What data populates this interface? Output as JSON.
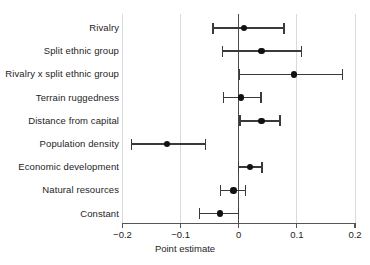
{
  "chart_data": {
    "type": "scatter",
    "subtype": "coefficient-plot-with-error-bars",
    "title": "",
    "xlabel": "Point estimate",
    "ylabel": "",
    "xlim": [
      -0.2,
      0.2
    ],
    "xticks": [
      -0.2,
      -0.1,
      0,
      0.1,
      0.2
    ],
    "xtick_labels": [
      "−0.2",
      "−0.1",
      "0",
      "0.1",
      "0.2"
    ],
    "grid": "vertical",
    "reference_line": 0,
    "legend": "none",
    "categories": [
      "Rivalry",
      "Split ethnic group",
      "Rivalry x split ethnic group",
      "Terrain ruggedness",
      "Distance from capital",
      "Population density",
      "Economic development",
      "Natural resources",
      "Constant"
    ],
    "values": [
      0.009,
      0.039,
      0.095,
      0.004,
      0.039,
      -0.123,
      0.019,
      -0.009,
      -0.032
    ],
    "ci_low": [
      -0.044,
      -0.028,
      0.001,
      -0.026,
      0.002,
      -0.185,
      0.0,
      -0.031,
      -0.067
    ],
    "ci_high": [
      0.078,
      0.108,
      0.178,
      0.038,
      0.071,
      -0.057,
      0.04,
      0.012,
      0.0
    ],
    "points": [
      {
        "label": "Rivalry",
        "estimate": 0.009,
        "ci_low": -0.044,
        "ci_high": 0.078
      },
      {
        "label": "Split ethnic group",
        "estimate": 0.039,
        "ci_low": -0.028,
        "ci_high": 0.108
      },
      {
        "label": "Rivalry x split ethnic group",
        "estimate": 0.095,
        "ci_low": 0.001,
        "ci_high": 0.178
      },
      {
        "label": "Terrain ruggedness",
        "estimate": 0.004,
        "ci_low": -0.026,
        "ci_high": 0.038
      },
      {
        "label": "Distance from capital",
        "estimate": 0.039,
        "ci_low": 0.002,
        "ci_high": 0.071
      },
      {
        "label": "Population density",
        "estimate": -0.123,
        "ci_low": -0.185,
        "ci_high": -0.057
      },
      {
        "label": "Economic development",
        "estimate": 0.019,
        "ci_low": 0.0,
        "ci_high": 0.04
      },
      {
        "label": "Natural resources",
        "estimate": -0.009,
        "ci_low": -0.031,
        "ci_high": 0.012
      },
      {
        "label": "Constant",
        "estimate": -0.032,
        "ci_low": -0.067,
        "ci_high": 0.0
      }
    ],
    "colors": {
      "point": "#111111",
      "error_bar": "#3a3a3a",
      "grid": "#d9d9d9",
      "zero_line": "#4a4a4a",
      "axis": "#555555",
      "text": "#242424",
      "background": "#ffffff"
    }
  }
}
